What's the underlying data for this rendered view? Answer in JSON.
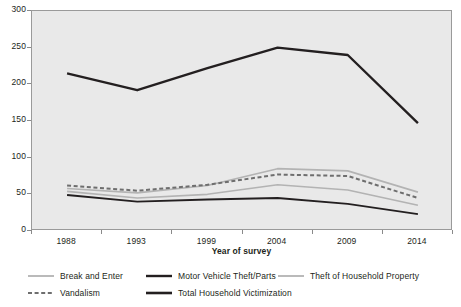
{
  "chart_data": {
    "type": "line",
    "title": "",
    "xlabel": "Year of survey",
    "ylabel": "",
    "x": [
      "1988",
      "1993",
      "1999",
      "2004",
      "2009",
      "2014"
    ],
    "categories": [
      "1988",
      "1993",
      "1999",
      "2004",
      "2009",
      "2014"
    ],
    "ylim": [
      0,
      300
    ],
    "yticks": [
      0,
      50,
      100,
      150,
      200,
      250,
      300
    ],
    "ytick_labels": [
      "0",
      "50",
      "100",
      "150",
      "200",
      "250",
      "300"
    ],
    "grid": false,
    "legend_position": "bottom",
    "series": [
      {
        "name": "Break and Enter",
        "values": [
          54,
          45,
          50,
          63,
          56,
          35
        ],
        "color": "#b3b3b3",
        "style": "solid",
        "width": 1.6
      },
      {
        "name": "Motor Vehicle Theft/Parts",
        "values": [
          49,
          40,
          43,
          45,
          37,
          23
        ],
        "color": "#231f20",
        "style": "solid",
        "width": 1.9
      },
      {
        "name": "Theft of Household Property",
        "values": [
          58,
          52,
          62,
          85,
          82,
          53
        ],
        "color": "#b3b3b3",
        "style": "solid",
        "width": 1.6
      },
      {
        "name": "Vandalism",
        "values": [
          62,
          55,
          63,
          77,
          75,
          45
        ],
        "color": "#6e6e6e",
        "style": "dashed",
        "width": 2.0
      },
      {
        "name": "Total Household Victimization",
        "values": [
          215,
          192,
          222,
          250,
          240,
          147
        ],
        "color": "#231f20",
        "style": "solid",
        "width": 2.4
      }
    ]
  },
  "axis": {
    "x_title": "Year of survey",
    "y_tick_labels": [
      "300",
      "250",
      "200",
      "150",
      "100",
      "50",
      "0"
    ],
    "x_tick_labels": [
      "1988",
      "1993",
      "1999",
      "2004",
      "2009",
      "2014"
    ]
  },
  "legend": {
    "rows": [
      [
        {
          "label": "Break and Enter",
          "color": "#b3b3b3",
          "style": "solid",
          "width": 1.8
        },
        {
          "label": "Motor Vehicle Theft/Parts",
          "color": "#231f20",
          "style": "solid",
          "width": 2.4
        },
        {
          "label": "Theft of Household Property",
          "color": "#b3b3b3",
          "style": "solid",
          "width": 1.8
        }
      ],
      [
        {
          "label": "Vandalism",
          "color": "#6e6e6e",
          "style": "dashed",
          "width": 2.2
        },
        {
          "label": "Total Household Victimization",
          "color": "#231f20",
          "style": "solid",
          "width": 2.6
        }
      ]
    ]
  },
  "colors": {
    "plot_background": "#e9e9e9",
    "page_background": "#ffffff",
    "axis_line": "#8a8a8a",
    "text": "#231f20",
    "light_series": "#b3b3b3",
    "mid_series": "#6e6e6e",
    "dark_series": "#231f20"
  }
}
